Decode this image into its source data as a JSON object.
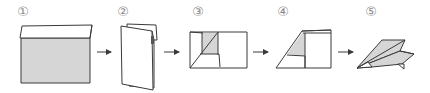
{
  "diagram": {
    "steps": [
      {
        "label": "①",
        "x": 23,
        "y": 11,
        "description": "Sheet with top edge folded over"
      },
      {
        "label": "②",
        "x": 123,
        "y": 11,
        "description": "Folded in half lengthwise"
      },
      {
        "label": "③",
        "x": 198,
        "y": 11,
        "description": "Corner folded diagonally"
      },
      {
        "label": "④",
        "x": 283,
        "y": 11,
        "description": "Angled fold forming nose"
      },
      {
        "label": "⑤",
        "x": 371,
        "y": 11,
        "description": "Finished paper airplane"
      }
    ],
    "arrows": [
      {
        "from": 1,
        "to": 2
      },
      {
        "from": 2,
        "to": 3
      },
      {
        "from": 3,
        "to": 4
      },
      {
        "from": 4,
        "to": 5
      }
    ],
    "colors": {
      "stroke": "#3a3a3a",
      "fill_gray": "#d6d6d6",
      "fill_white": "#ffffff",
      "label": "#8a8a8a"
    }
  }
}
